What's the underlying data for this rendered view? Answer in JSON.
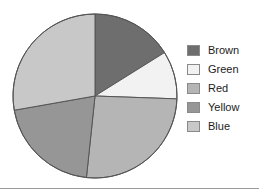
{
  "chart_data": {
    "type": "pie",
    "title": "",
    "legend_position": "right",
    "categories": [
      "Brown",
      "Green",
      "Red",
      "Yellow",
      "Blue"
    ],
    "values": [
      16,
      9,
      26,
      21,
      28
    ],
    "units": "percent",
    "start_angle_deg": 0,
    "direction": "clockwise",
    "slices": [
      {
        "label": "Brown",
        "value": 16,
        "color": "#6e6e6e",
        "start_angle_deg": 0,
        "end_angle_deg": 58
      },
      {
        "label": "Green",
        "value": 9,
        "color": "#f2f2f2",
        "start_angle_deg": 58,
        "end_angle_deg": 92
      },
      {
        "label": "Red",
        "value": 26,
        "color": "#b5b5b5",
        "start_angle_deg": 92,
        "end_angle_deg": 186
      },
      {
        "label": "Yellow",
        "value": 21,
        "color": "#969696",
        "start_angle_deg": 186,
        "end_angle_deg": 260
      },
      {
        "label": "Blue",
        "value": 28,
        "color": "#c8c8c8",
        "start_angle_deg": 260,
        "end_angle_deg": 360
      }
    ],
    "outline_color": "#555555",
    "geometry": {
      "center_x": 95,
      "center_y": 96,
      "radius": 82
    }
  },
  "legend": {
    "items": [
      {
        "label": "Brown",
        "color": "#6e6e6e"
      },
      {
        "label": "Green",
        "color": "#f2f2f2"
      },
      {
        "label": "Red",
        "color": "#b5b5b5"
      },
      {
        "label": "Yellow",
        "color": "#969696"
      },
      {
        "label": "Blue",
        "color": "#c8c8c8"
      }
    ]
  }
}
